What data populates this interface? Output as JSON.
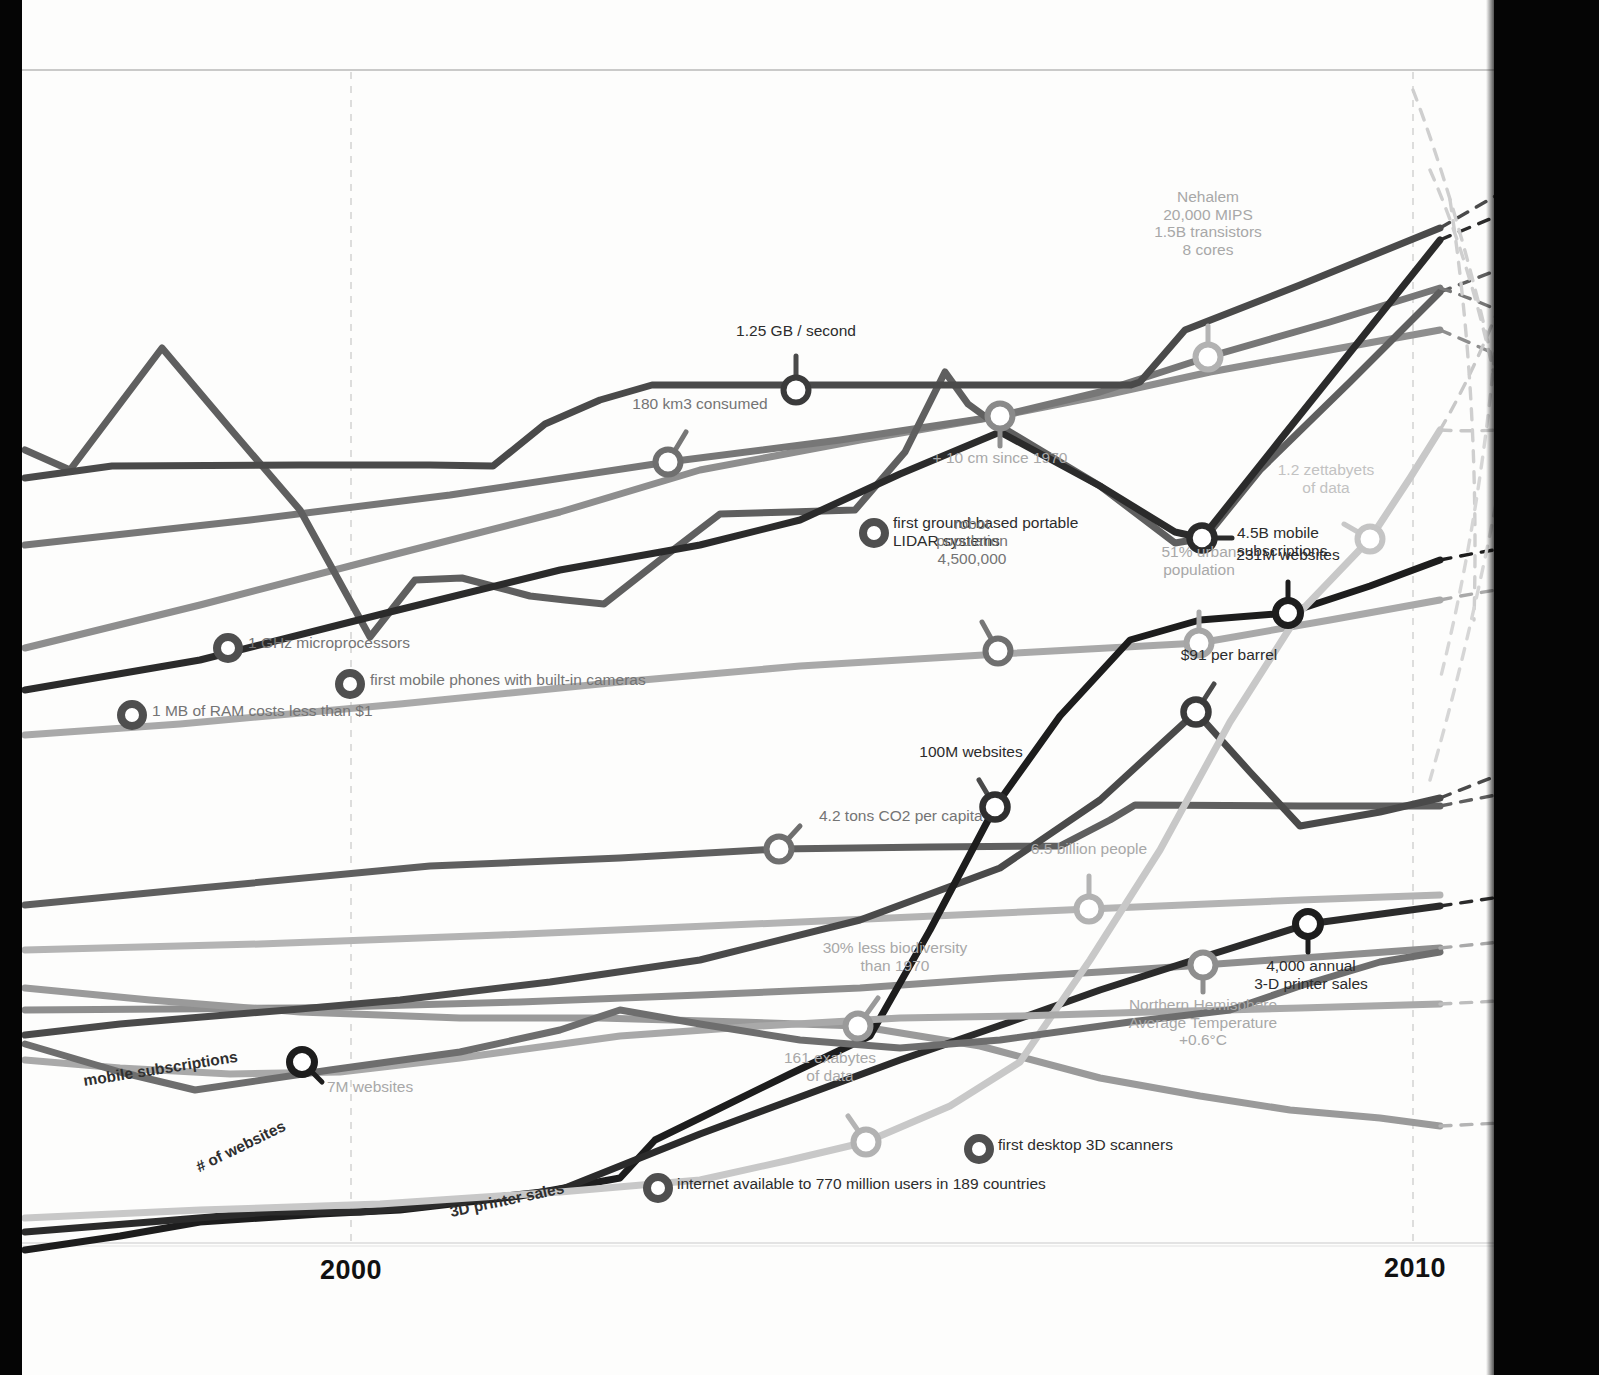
{
  "axis": {
    "years": [
      {
        "label": "2000",
        "x": 320,
        "y": 1255
      },
      {
        "label": "2010",
        "x": 1384,
        "y": 1253
      }
    ],
    "gridline_years": [
      2000,
      2010
    ],
    "top_rule_y": 70,
    "bottom_rule_y": 1243
  },
  "colors": {
    "black": "#1d1d1d",
    "near_black": "#2b2b2b",
    "dark_gray": "#4a4a4a",
    "mid_dark_gray": "#5f5f5f",
    "mid_gray": "#777777",
    "gray": "#8e8e8e",
    "light_gray": "#a9a9a9",
    "lighter_gray": "#bdbdbd",
    "very_light_gray": "#d0d0d0",
    "grid": "#cfcfcf",
    "page_edge": "#050505"
  },
  "series_labels": [
    {
      "name": "mobile-subscriptions",
      "text": "mobile subscriptions",
      "x": 85,
      "y": 1072,
      "rotate": -9
    },
    {
      "name": "number-of-websites",
      "text": "# of websites",
      "x": 201,
      "y": 1158,
      "rotate": -26
    },
    {
      "name": "3d-printer-sales",
      "text": "3D printer sales",
      "x": 452,
      "y": 1203,
      "rotate": -12
    }
  ],
  "annotations": [
    {
      "name": "ghz-microprocessors",
      "text": "1 GHz microprocessors",
      "marker": "ring-dark",
      "mx": 228,
      "my": 648,
      "lx": 248,
      "ly": 638,
      "align": "left",
      "tone": "c-mid",
      "width": 260
    },
    {
      "name": "mobile-phones-cameras",
      "text": "first mobile phones with built-in cameras",
      "marker": "ring-dark",
      "mx": 350,
      "my": 684,
      "lx": 370,
      "ly": 675,
      "align": "left",
      "tone": "c-mid",
      "width": 330
    },
    {
      "name": "ram-cost",
      "text": "1 MB of RAM costs less than $1",
      "marker": "ring-dark",
      "mx": 132,
      "my": 715,
      "lx": 152,
      "ly": 706,
      "align": "left",
      "tone": "c-mid",
      "width": 280
    },
    {
      "name": "lidar-systems",
      "text": "first ground-based portable\nLIDAR systems",
      "marker": "ring-dark",
      "mx": 874,
      "my": 533,
      "lx": 893,
      "ly": 518,
      "align": "left",
      "tone": "c-dark",
      "width": 260
    },
    {
      "name": "desktop-3d-scanners",
      "text": "first desktop 3D scanners",
      "marker": "ring-dark",
      "mx": 979,
      "my": 1149,
      "lx": 998,
      "ly": 1140,
      "align": "left",
      "tone": "c-dark",
      "width": 230
    },
    {
      "name": "internet-users",
      "text": "internet available to 770 million users in 189 countries",
      "marker": "ring-dark",
      "mx": 658,
      "my": 1188,
      "lx": 677,
      "ly": 1179,
      "align": "left",
      "tone": "c-dark",
      "width": 420
    },
    {
      "name": "gb-per-second",
      "text": "1.25 GB / second",
      "marker": "node-dark",
      "mx": 796,
      "my": 390,
      "lx": 796,
      "ly": 339,
      "align": "center",
      "tone": "c-dark",
      "width": 220
    },
    {
      "name": "water-consumed",
      "text": "180 km3 consumed",
      "marker": "node-mid",
      "mx": 668,
      "my": 462,
      "lx": 700,
      "ly": 412,
      "align": "center",
      "tone": "c-mid",
      "width": 220
    },
    {
      "name": "sea-level-rise",
      "text": "+ 10 cm since 1970",
      "marker": "node-mid",
      "mx": 1000,
      "my": 416,
      "lx": 1000,
      "ly": 449,
      "align": "center",
      "tone": "c-light",
      "width": 220
    },
    {
      "name": "nehalem-processor",
      "text": "Nehalem\n20,000 MIPS\n1.5B transistors\n8 cores",
      "marker": "node-light",
      "mx": 1208,
      "my": 357,
      "lx": 1208,
      "ly": 258,
      "align": "center",
      "tone": "c-light",
      "width": 220
    },
    {
      "name": "robot-population",
      "text": "robot\npopulation\n4,500,000",
      "marker": "node-mid",
      "mx": 998,
      "my": 651,
      "lx": 972,
      "ly": 567,
      "align": "center",
      "tone": "c-mid",
      "width": 180
    },
    {
      "name": "mobile-subscriptions-value",
      "text": "4.5B mobile\nsubscriptions",
      "marker": "node-dark",
      "mx": 1202,
      "my": 538,
      "lx": 1237,
      "ly": 528,
      "align": "left",
      "tone": "c-dark",
      "width": 200
    },
    {
      "name": "zettabytes-of-data",
      "text": "1.2 zettabyets\nof data",
      "marker": "node-vlight",
      "mx": 1370,
      "my": 539,
      "lx": 1326,
      "ly": 496,
      "align": "center",
      "tone": "c-vlight",
      "width": 200
    },
    {
      "name": "urban-population",
      "text": "51% urban\npopulation",
      "marker": "node-light",
      "mx": 1199,
      "my": 643,
      "lx": 1199,
      "ly": 578,
      "align": "center",
      "tone": "c-light",
      "width": 170
    },
    {
      "name": "websites-231m",
      "text": "231M websites",
      "marker": "node-black",
      "mx": 1288,
      "my": 613,
      "lx": 1288,
      "ly": 563,
      "align": "center",
      "tone": "c-dark",
      "width": 210
    },
    {
      "name": "oil-price",
      "text": "$91 per barrel",
      "marker": "node-dark",
      "mx": 1196,
      "my": 712,
      "lx": 1229,
      "ly": 663,
      "align": "center",
      "tone": "c-dark",
      "width": 200
    },
    {
      "name": "websites-100m",
      "text": "100M websites",
      "marker": "node-dark",
      "mx": 995,
      "my": 807,
      "lx": 971,
      "ly": 760,
      "align": "center",
      "tone": "c-dark",
      "width": 200
    },
    {
      "name": "co2-per-capita",
      "text": "4.2 tons CO2 per capita",
      "marker": "node-mid",
      "mx": 779,
      "my": 849,
      "lx": 819,
      "ly": 811,
      "align": "left",
      "tone": "c-mid",
      "width": 260
    },
    {
      "name": "world-population",
      "text": "6.5 billion people",
      "marker": "node-light",
      "mx": 1089,
      "my": 909,
      "lx": 1089,
      "ly": 857,
      "align": "center",
      "tone": "c-light",
      "width": 210
    },
    {
      "name": "biodiversity-loss",
      "text": "30% less biodiversity\nthan 1970",
      "marker": "node-light",
      "mx": 858,
      "my": 1026,
      "lx": 895,
      "ly": 974,
      "align": "center",
      "tone": "c-light",
      "width": 220
    },
    {
      "name": "northern-temperature",
      "text": "Northern Hemisphere\nAverage Temperature\n+0.6°C",
      "marker": "node-light",
      "mx": 1203,
      "my": 965,
      "lx": 1203,
      "ly": 996,
      "align": "center",
      "tone": "c-light",
      "width": 230
    },
    {
      "name": "printer-sales-value",
      "text": "4,000 annual\n3-D printer sales",
      "marker": "node-black",
      "mx": 1308,
      "my": 924,
      "lx": 1311,
      "ly": 957,
      "align": "center",
      "tone": "c-dark",
      "width": 210
    },
    {
      "name": "exabytes-of-data",
      "text": "161 exabytes\nof data",
      "marker": "node-light",
      "mx": 866,
      "my": 1142,
      "lx": 830,
      "ly": 1084,
      "align": "center",
      "tone": "c-light",
      "width": 180
    },
    {
      "name": "websites-7m",
      "text": "7M websites",
      "marker": "node-black",
      "mx": 302,
      "my": 1062,
      "lx": 327,
      "ly": 1082,
      "align": "left",
      "tone": "c-light",
      "width": 180
    }
  ],
  "chart_data": {
    "type": "line",
    "xlabel": "",
    "ylabel": "",
    "xlim": [
      1995,
      2010
    ],
    "tick_labels": [
      "2000",
      "2010"
    ],
    "grid": "vertical dashed gridlines at 2000 and 2010",
    "legend": "inline series labels drawn along the curves",
    "series": [
      {
        "name": "network-speed",
        "label": "1.25 GB / second",
        "color": "#4a4a4a",
        "points": [
          [
            25,
            478
          ],
          [
            112,
            466
          ],
          [
            300,
            465
          ],
          [
            493,
            466
          ],
          [
            545,
            424
          ],
          [
            652,
            385
          ],
          [
            1131,
            385
          ],
          [
            1132,
            385
          ],
          [
            1185,
            330
          ],
          [
            1440,
            228
          ]
        ]
      },
      {
        "name": "water-consumption",
        "label": "180 km3 consumed",
        "color": "#777777",
        "points": [
          [
            25,
            540
          ],
          [
            668,
            462
          ],
          [
            1000,
            416
          ],
          [
            1208,
            357
          ],
          [
            1440,
            288
          ]
        ]
      },
      {
        "name": "sea-level",
        "label": "+ 10 cm since 1970",
        "color": "#8e8e8e",
        "points": [
          [
            25,
            640
          ],
          [
            400,
            545
          ],
          [
            700,
            470
          ],
          [
            1000,
            416
          ],
          [
            1210,
            372
          ],
          [
            1440,
            330
          ]
        ]
      },
      {
        "name": "microprocessor-power",
        "label": "Nehalem 20,000 MIPS",
        "color": "#5f5f5f",
        "points": [
          [
            25,
            455
          ],
          [
            70,
            470
          ],
          [
            162,
            348
          ],
          [
            233,
            430
          ],
          [
            370,
            635
          ],
          [
            460,
            578
          ],
          [
            530,
            594
          ],
          [
            604,
            603
          ],
          [
            720,
            513
          ],
          [
            855,
            510
          ],
          [
            945,
            372
          ],
          [
            990,
            420
          ],
          [
            1175,
            543
          ],
          [
            1205,
            538
          ],
          [
            1260,
            470
          ],
          [
            1440,
            292
          ]
        ]
      },
      {
        "name": "mobile-subscriptions",
        "label": "4.5B mobile subscriptions",
        "color": "#2b2b2b",
        "points": [
          [
            25,
            690
          ],
          [
            390,
            610
          ],
          [
            800,
            520
          ],
          [
            1000,
            430
          ],
          [
            1202,
            538
          ],
          [
            1440,
            240
          ]
        ]
      },
      {
        "name": "data-volume",
        "label": "1.2 zettabyets of data",
        "color": "#c8c8c8",
        "points": [
          [
            25,
            1215
          ],
          [
            380,
            1205
          ],
          [
            700,
            1180
          ],
          [
            866,
            1142
          ],
          [
            1000,
            1080
          ],
          [
            1150,
            880
          ],
          [
            1280,
            640
          ],
          [
            1370,
            539
          ],
          [
            1440,
            430
          ]
        ]
      },
      {
        "name": "urban-population",
        "label": "51% urban population",
        "color": "#a9a9a9",
        "points": [
          [
            25,
            735
          ],
          [
            400,
            700
          ],
          [
            800,
            660
          ],
          [
            1199,
            643
          ],
          [
            1440,
            600
          ]
        ]
      },
      {
        "name": "websites",
        "label": "231M websites",
        "color": "#1d1d1d",
        "points": [
          [
            25,
            1250
          ],
          [
            200,
            1222
          ],
          [
            400,
            1210
          ],
          [
            620,
            1178
          ],
          [
            700,
            1120
          ],
          [
            870,
            1040
          ],
          [
            995,
            807
          ],
          [
            1130,
            640
          ],
          [
            1288,
            613
          ],
          [
            1440,
            560
          ]
        ]
      },
      {
        "name": "co2-emissions",
        "label": "4.2 tons CO2 per capita",
        "color": "#5f5f5f",
        "points": [
          [
            25,
            905
          ],
          [
            430,
            866
          ],
          [
            779,
            849
          ],
          [
            1060,
            846
          ],
          [
            1130,
            805
          ],
          [
            1440,
            806
          ]
        ]
      },
      {
        "name": "oil-price",
        "label": "$91 per barrel",
        "color": "#4a4a4a",
        "points": [
          [
            25,
            1035
          ],
          [
            190,
            1018
          ],
          [
            400,
            1000
          ],
          [
            700,
            960
          ],
          [
            1000,
            870
          ],
          [
            1196,
            712
          ],
          [
            1300,
            825
          ],
          [
            1440,
            798
          ]
        ]
      },
      {
        "name": "world-population",
        "label": "6.5 billion people",
        "color": "#b4b4b4",
        "points": [
          [
            25,
            950
          ],
          [
            500,
            935
          ],
          [
            1089,
            909
          ],
          [
            1300,
            900
          ],
          [
            1440,
            895
          ]
        ]
      },
      {
        "name": "biodiversity",
        "label": "30% less biodiversity",
        "color": "#9a9a9a",
        "points": [
          [
            25,
            990
          ],
          [
            300,
            1010
          ],
          [
            600,
            1020
          ],
          [
            858,
            1026
          ],
          [
            1100,
            1080
          ],
          [
            1280,
            1110
          ],
          [
            1440,
            1125
          ]
        ]
      },
      {
        "name": "average-temperature",
        "label": "Northern Hemisphere Average Temperature +0.6°C",
        "color": "#8e8e8e",
        "points": [
          [
            25,
            1010
          ],
          [
            300,
            1008
          ],
          [
            700,
            995
          ],
          [
            1000,
            978
          ],
          [
            1203,
            965
          ],
          [
            1440,
            948
          ]
        ]
      },
      {
        "name": "3d-printer-sales",
        "label": "4,000 annual 3-D printer sales",
        "color": "#2b2b2b",
        "points": [
          [
            25,
            1218
          ],
          [
            270,
            1210
          ],
          [
            420,
            1206
          ],
          [
            560,
            1190
          ],
          [
            900,
            1060
          ],
          [
            1100,
            990
          ],
          [
            1308,
            924
          ],
          [
            1440,
            908
          ]
        ]
      }
    ]
  }
}
